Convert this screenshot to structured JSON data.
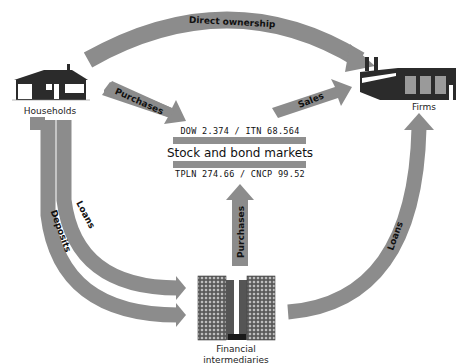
{
  "nodes": {
    "households": {
      "label": "Households"
    },
    "firms": {
      "label": "Firms"
    },
    "markets": {
      "label": "Stock and bond markets",
      "ticker_top": "DOW 2.374 / ITN 68.564",
      "ticker_bottom": "TPLN 274.66 / CNCP 99.52"
    },
    "intermediaries": {
      "label_line1": "Financial",
      "label_line2": "intermediaries"
    }
  },
  "flows": {
    "direct_ownership": "Direct ownership",
    "purchases_households": "Purchases",
    "sales": "Sales",
    "purchases_intermediaries": "Purchases",
    "deposits": "Deposits",
    "loans_households": "Loans",
    "loans_firms": "Loans"
  },
  "colors": {
    "arrow": "#8c8c8c",
    "dark": "#2b2b2b",
    "window": "#9a9a9a",
    "band": "#8f8f8f"
  }
}
